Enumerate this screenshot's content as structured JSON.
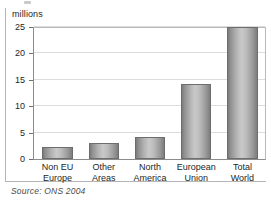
{
  "chart_data": {
    "type": "bar",
    "title": "",
    "subtitle": "",
    "xlabel": "",
    "ylabel": "millions",
    "categories": [
      "Non EU Europe",
      "Other Areas",
      "North America",
      "European Union",
      "Total World"
    ],
    "category_lines": [
      [
        "Non EU",
        "Europe"
      ],
      [
        "Other",
        "Areas"
      ],
      [
        "North",
        "America"
      ],
      [
        "European",
        "Union"
      ],
      [
        "Total",
        "World"
      ]
    ],
    "values": [
      2.2,
      3.1,
      4.1,
      14.3,
      25.0
    ],
    "ylim": [
      0,
      25
    ],
    "yticks": [
      0,
      5,
      10,
      15,
      20,
      25
    ],
    "ytick_labels": [
      "0",
      "5",
      "10",
      "15",
      "20",
      "25"
    ],
    "grid": true,
    "legend": "none",
    "bar_color": "#b4b4b4",
    "bar_edge_color": "#6d6d6d",
    "gridline_color": "#dcdcdc",
    "axis_color": "#8c8c8c",
    "text_color": "#231f1f"
  },
  "source": {
    "text": "Source: ONS 2004"
  }
}
